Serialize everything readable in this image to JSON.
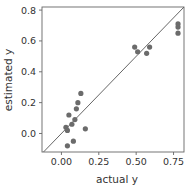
{
  "chart_data": {
    "type": "scatter",
    "title": "",
    "xlabel": "actual y",
    "ylabel": "estimated y",
    "xlim": [
      -0.13,
      0.82
    ],
    "ylim": [
      -0.12,
      0.82
    ],
    "xticks": [
      0.0,
      0.25,
      0.5,
      0.75
    ],
    "xtick_labels": [
      "0.00",
      "0.25",
      "0.50",
      "0.75"
    ],
    "yticks": [
      0.0,
      0.2,
      0.4,
      0.6,
      0.8
    ],
    "ytick_labels": [
      "0.0",
      "0.2",
      "0.4",
      "0.6",
      "0.8"
    ],
    "grid": false,
    "legend": null,
    "reference_line": {
      "label": "y = x",
      "from": [
        -0.13,
        -0.13
      ],
      "to": [
        0.82,
        0.82
      ]
    },
    "point_color": "#6b6b6b",
    "line_color": "#555555",
    "series": [
      {
        "name": "points",
        "x": [
          0.13,
          0.11,
          0.1,
          0.05,
          0.09,
          0.07,
          0.03,
          0.04,
          0.16,
          0.08,
          0.04,
          0.49,
          0.51,
          0.57,
          0.59,
          0.78,
          0.78,
          0.78
        ],
        "y": [
          0.26,
          0.2,
          0.16,
          0.12,
          0.09,
          0.06,
          0.04,
          0.02,
          0.03,
          -0.05,
          -0.08,
          0.56,
          0.53,
          0.52,
          0.56,
          0.71,
          0.69,
          0.65
        ]
      }
    ]
  }
}
